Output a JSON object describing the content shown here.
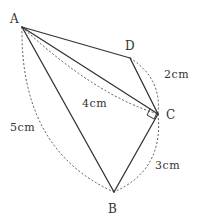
{
  "diagram": {
    "type": "geometry-figure",
    "points": {
      "A": {
        "label": "A",
        "x": 22,
        "y": 27
      },
      "B": {
        "label": "B",
        "x": 114,
        "y": 192
      },
      "C": {
        "label": "C",
        "x": 158,
        "y": 114
      },
      "D": {
        "label": "D",
        "x": 130,
        "y": 58
      }
    },
    "segments": [
      {
        "from": "A",
        "to": "D",
        "style": "solid"
      },
      {
        "from": "D",
        "to": "C",
        "style": "solid"
      },
      {
        "from": "A",
        "to": "C",
        "style": "solid"
      },
      {
        "from": "C",
        "to": "B",
        "style": "solid"
      },
      {
        "from": "A",
        "to": "B",
        "style": "solid"
      }
    ],
    "measurements": {
      "DC": "2cm",
      "AC": "4cm",
      "AB": "5cm",
      "CB": "3cm"
    },
    "right_angle_at": "C",
    "colors": {
      "line": "#333333",
      "dashed": "#444444",
      "background": "#ffffff"
    }
  }
}
